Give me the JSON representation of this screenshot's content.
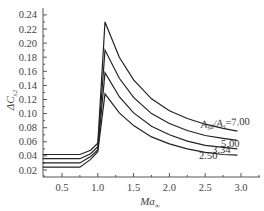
{
  "chart_data": {
    "type": "line",
    "title": "",
    "xlabel": "Ma∞",
    "ylabel": "ΔC_x2",
    "xlim": [
      0.23,
      3.27
    ],
    "ylim": [
      0.01,
      0.25
    ],
    "grid": false,
    "legend_position": "inline labels at right end of curves",
    "x_ticks": [
      0.5,
      1.0,
      1.5,
      2.0,
      2.5,
      3.0
    ],
    "x_tick_labels": [
      "0.5",
      "1.0",
      "1.5",
      "2.0",
      "2.5",
      "3.0"
    ],
    "y_ticks": [
      0.02,
      0.04,
      0.06,
      0.08,
      0.1,
      0.12,
      0.14,
      0.16,
      0.18,
      0.2,
      0.22,
      0.24
    ],
    "y_tick_labels": [
      "0.02",
      "0.04",
      "0.06",
      "0.08",
      "0.10",
      "0.12",
      "0.14",
      "0.16",
      "0.18",
      "0.20",
      "0.22",
      "0.24"
    ],
    "x": [
      0.23,
      0.5,
      0.75,
      0.9,
      1.0,
      1.1,
      1.3,
      1.5,
      1.75,
      2.0,
      2.25,
      2.5,
      2.75,
      2.95
    ],
    "series": [
      {
        "name": "A_sd/A_s=7.00",
        "label": "Aₛₑ/Aₛ=7.00",
        "values": [
          0.042,
          0.042,
          0.042,
          0.048,
          0.058,
          0.23,
          0.18,
          0.148,
          0.121,
          0.104,
          0.093,
          0.085,
          0.079,
          0.075
        ]
      },
      {
        "name": "5.00",
        "label": "5.00",
        "values": [
          0.036,
          0.036,
          0.036,
          0.043,
          0.053,
          0.19,
          0.15,
          0.123,
          0.1,
          0.086,
          0.076,
          0.069,
          0.065,
          0.062
        ]
      },
      {
        "name": "3.34",
        "label": "3.34",
        "values": [
          0.03,
          0.03,
          0.03,
          0.039,
          0.049,
          0.158,
          0.124,
          0.101,
          0.082,
          0.07,
          0.061,
          0.055,
          0.052,
          0.05
        ]
      },
      {
        "name": "2.50",
        "label": "2.50",
        "values": [
          0.024,
          0.024,
          0.024,
          0.035,
          0.046,
          0.128,
          0.101,
          0.083,
          0.067,
          0.057,
          0.05,
          0.045,
          0.042,
          0.041
        ]
      }
    ],
    "line_color": "#222222"
  },
  "labels": {
    "y_axis_title_main": "ΔC",
    "y_axis_title_sub": "x2",
    "x_axis_title_main": "Ma",
    "x_axis_title_sub": "∞",
    "legend_prefix_A1": "A",
    "legend_prefix_sub1": "sd",
    "legend_slash": "/A",
    "legend_prefix_sub2": "s",
    "legend_value_first": "=7.00"
  }
}
